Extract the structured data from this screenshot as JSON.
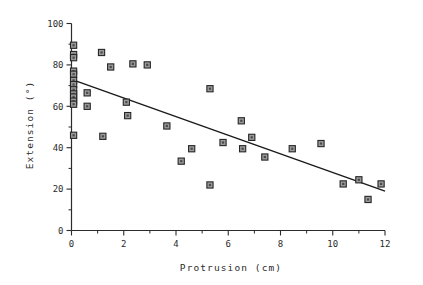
{
  "chart_data": {
    "type": "scatter",
    "title": "",
    "xlabel": "Protrusion (cm)",
    "ylabel": "Extension (°)",
    "xlim": [
      0,
      12
    ],
    "ylim": [
      0,
      100
    ],
    "grid": false,
    "legend": "none",
    "x_ticks": [
      0,
      2,
      4,
      6,
      8,
      10,
      12
    ],
    "x_tick_labels": [
      "0",
      "2",
      "4",
      "6",
      "8",
      "10",
      "12"
    ],
    "x_minor_ticks": [
      1,
      3,
      5,
      7,
      9,
      11
    ],
    "y_ticks": [
      0,
      20,
      40,
      60,
      80,
      100
    ],
    "y_tick_labels": [
      "0",
      "20",
      "40",
      "60",
      "80",
      "100"
    ],
    "y_minor_ticks": [
      10,
      30,
      50,
      70,
      90
    ],
    "marker": "square",
    "marker_fill": "#9a9a9a",
    "marker_edge": "#262626",
    "points": [
      {
        "x": 0.08,
        "y": 89.5
      },
      {
        "x": 0.08,
        "y": 85.0
      },
      {
        "x": 0.08,
        "y": 83.5
      },
      {
        "x": 0.08,
        "y": 77.0
      },
      {
        "x": 0.08,
        "y": 75.5
      },
      {
        "x": 0.08,
        "y": 72.5
      },
      {
        "x": 0.08,
        "y": 70.5
      },
      {
        "x": 0.08,
        "y": 68.0
      },
      {
        "x": 0.08,
        "y": 66.0
      },
      {
        "x": 0.08,
        "y": 64.5
      },
      {
        "x": 0.08,
        "y": 62.5
      },
      {
        "x": 0.08,
        "y": 61.0
      },
      {
        "x": 0.08,
        "y": 46.0
      },
      {
        "x": 0.6,
        "y": 66.5
      },
      {
        "x": 0.6,
        "y": 60.0
      },
      {
        "x": 1.15,
        "y": 86.0
      },
      {
        "x": 1.2,
        "y": 45.5
      },
      {
        "x": 1.5,
        "y": 79.0
      },
      {
        "x": 2.1,
        "y": 62.0
      },
      {
        "x": 2.15,
        "y": 55.5
      },
      {
        "x": 2.35,
        "y": 80.5
      },
      {
        "x": 2.9,
        "y": 80.0
      },
      {
        "x": 3.65,
        "y": 50.5
      },
      {
        "x": 4.2,
        "y": 33.5
      },
      {
        "x": 4.6,
        "y": 39.5
      },
      {
        "x": 5.3,
        "y": 68.5
      },
      {
        "x": 5.3,
        "y": 22.0
      },
      {
        "x": 5.8,
        "y": 42.5
      },
      {
        "x": 6.5,
        "y": 53.0
      },
      {
        "x": 6.55,
        "y": 39.5
      },
      {
        "x": 6.9,
        "y": 45.0
      },
      {
        "x": 7.4,
        "y": 35.5
      },
      {
        "x": 8.45,
        "y": 39.5
      },
      {
        "x": 9.55,
        "y": 42.0
      },
      {
        "x": 10.4,
        "y": 22.5
      },
      {
        "x": 11.0,
        "y": 24.5
      },
      {
        "x": 11.35,
        "y": 15.0
      },
      {
        "x": 11.85,
        "y": 22.5
      }
    ],
    "fit_line": {
      "type": "linear_regression",
      "x_start": 0.0,
      "y_start": 73.0,
      "x_end": 12.0,
      "y_end": 19.0
    }
  }
}
